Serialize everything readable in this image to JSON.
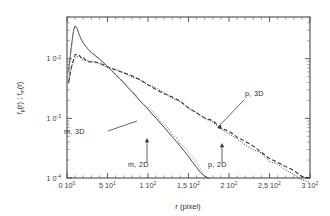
{
  "figure": {
    "background": "#ffffff",
    "frame_color": "#4a4a4a"
  },
  "axes": {
    "x_title": "r   (pixel)",
    "y_title_parts": {
      "p1": "f",
      "p1sub": "p",
      "p2": "(r)   ;   f",
      "p2sub": "m",
      "p3": "(r)"
    },
    "x_ticklabels": [
      {
        "mant": "0",
        "base": "10",
        "exp": "0"
      },
      {
        "mant": "5",
        "base": "10",
        "exp": "1"
      },
      {
        "mant": "1",
        "base": "10",
        "exp": "2"
      },
      {
        "mant": "1,5",
        "base": "10",
        "exp": "2"
      },
      {
        "mant": "2",
        "base": "10",
        "exp": "2"
      },
      {
        "mant": "2,5",
        "base": "10",
        "exp": "2"
      },
      {
        "mant": "3",
        "base": "10",
        "exp": "2"
      }
    ],
    "y_ticklabels": [
      {
        "mant": "1",
        "base": "0",
        "exp": "-2"
      },
      {
        "mant": "1",
        "base": "0",
        "exp": "-3"
      },
      {
        "mant": "1",
        "base": "0",
        "exp": "-4"
      }
    ]
  },
  "annotations": [
    {
      "id": "m3d",
      "label": "m,  3D"
    },
    {
      "id": "m2d",
      "label": "m,  2D"
    },
    {
      "id": "p2d",
      "label": "p,  2D"
    },
    {
      "id": "p3d",
      "label": "p,  3D"
    }
  ],
  "chart_data": {
    "type": "line",
    "title": "",
    "xlabel": "r   (pixel)",
    "ylabel": "f_p(r) ; f_m(r)",
    "xscale": "linear",
    "yscale": "log",
    "xlim": [
      0,
      300
    ],
    "ylim": [
      0.0001,
      0.05
    ],
    "grid": false,
    "legend": "inline-annotations",
    "xticks": [
      0,
      50,
      100,
      150,
      200,
      250,
      300
    ],
    "xtick_labels": [
      "0 10⁰",
      "5 10¹",
      "1 10²",
      "1,5 10²",
      "2 10²",
      "2,5 10²",
      "3 10²"
    ],
    "yticks": [
      0.01,
      0.001,
      0.0001
    ],
    "ytick_labels": [
      "10⁻²",
      "10⁻³",
      "10⁻⁴"
    ],
    "series": [
      {
        "name": "m, 3D",
        "style": "solid",
        "color": "#444444",
        "x": [
          2,
          5,
          8,
          10,
          12,
          14,
          16,
          18,
          20,
          25,
          30,
          35,
          40,
          45,
          50,
          55,
          60,
          65,
          70,
          75,
          80,
          85,
          90,
          95,
          100,
          105,
          110,
          115,
          120,
          125,
          130,
          135,
          140,
          145,
          150,
          155,
          160,
          165,
          170,
          175
        ],
        "y": [
          0.0062,
          0.0145,
          0.0295,
          0.0355,
          0.033,
          0.028,
          0.0235,
          0.0205,
          0.0185,
          0.015,
          0.0128,
          0.0112,
          0.0098,
          0.0086,
          0.0074,
          0.0063,
          0.0054,
          0.0046,
          0.0039,
          0.0033,
          0.0028,
          0.00235,
          0.00198,
          0.00167,
          0.00141,
          0.00119,
          0.001,
          0.00084,
          0.0007,
          0.00059,
          0.00049,
          0.00041,
          0.00034,
          0.00028,
          0.00023,
          0.000185,
          0.00015,
          0.000122,
          0.000108,
          0.0001
        ]
      },
      {
        "name": "m, 2D",
        "style": "gray-dotted",
        "color": "#9a9a9a",
        "x": [
          2,
          5,
          8,
          10,
          12,
          14,
          16,
          18,
          20,
          25,
          30,
          35,
          40,
          45,
          50,
          55,
          60,
          65,
          70,
          75,
          80,
          85,
          90,
          95,
          100,
          105,
          110,
          115,
          120,
          125,
          130,
          135,
          140,
          145,
          150,
          155,
          160,
          165,
          170
        ],
        "y": [
          0.0058,
          0.014,
          0.0288,
          0.0348,
          0.0325,
          0.0276,
          0.0232,
          0.0203,
          0.0183,
          0.0149,
          0.0127,
          0.0111,
          0.0097,
          0.0085,
          0.0073,
          0.0063,
          0.0054,
          0.0047,
          0.004,
          0.0034,
          0.0029,
          0.00247,
          0.0021,
          0.00178,
          0.00152,
          0.0013,
          0.0011,
          0.00093,
          0.00079,
          0.00067,
          0.00056,
          0.00047,
          0.00039,
          0.00033,
          0.00027,
          0.00022,
          0.000175,
          0.000135,
          0.000105
        ]
      },
      {
        "name": "p, 3D",
        "style": "dashed",
        "color": "#2d2d2d",
        "x": [
          2,
          5,
          8,
          10,
          12,
          14,
          16,
          18,
          20,
          25,
          30,
          35,
          40,
          50,
          60,
          70,
          80,
          90,
          100,
          110,
          120,
          130,
          140,
          150,
          160,
          170,
          180,
          190,
          200,
          210,
          220,
          230,
          240,
          250,
          260,
          270,
          280,
          290,
          300
        ],
        "y": [
          0.0042,
          0.0068,
          0.0098,
          0.0112,
          0.0116,
          0.0112,
          0.0108,
          0.0104,
          0.01,
          0.0094,
          0.009,
          0.0086,
          0.0083,
          0.0076,
          0.0068,
          0.006,
          0.0052,
          0.0045,
          0.0038,
          0.0032,
          0.0027,
          0.00225,
          0.00188,
          0.00155,
          0.00128,
          0.00106,
          0.00087,
          0.00072,
          0.00059,
          0.00049,
          0.0004,
          0.00033,
          0.00027,
          0.00022,
          0.000185,
          0.000152,
          0.000128,
          0.00011,
          9.8e-05
        ]
      },
      {
        "name": "p, 2D",
        "style": "dotted",
        "color": "#3d3d3d",
        "x": [
          2,
          5,
          8,
          10,
          12,
          14,
          16,
          18,
          20,
          25,
          30,
          35,
          40,
          50,
          60,
          70,
          80,
          90,
          100,
          110,
          120,
          130,
          140,
          150,
          160,
          170,
          180,
          190,
          200,
          210,
          220,
          230,
          240,
          250,
          260,
          270,
          280,
          290,
          300
        ],
        "y": [
          0.004,
          0.0065,
          0.0095,
          0.0108,
          0.0113,
          0.011,
          0.0106,
          0.0103,
          0.0099,
          0.0093,
          0.0089,
          0.0085,
          0.0082,
          0.0075,
          0.0067,
          0.0059,
          0.0051,
          0.0044,
          0.0037,
          0.0031,
          0.0026,
          0.00217,
          0.0018,
          0.00148,
          0.00122,
          0.001,
          0.00082,
          0.00067,
          0.00055,
          0.00045,
          0.00037,
          0.0003,
          0.00025,
          0.0002,
          0.000165,
          0.000135,
          0.000112,
          9.6e-05,
          8.4e-05
        ]
      }
    ]
  }
}
